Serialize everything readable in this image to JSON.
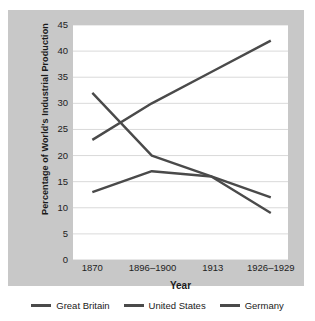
{
  "chart_data": {
    "type": "line",
    "title": "",
    "subtitle": "",
    "xlabel": "Year",
    "ylabel": "Percentage of World's Industrial Production",
    "categories": [
      "1870",
      "1896–1900",
      "1913",
      "1926–1929"
    ],
    "series": [
      {
        "name": "Great Britain",
        "values": [
          32,
          20,
          16,
          12
        ],
        "color": "#4a4a4a"
      },
      {
        "name": "United States",
        "values": [
          23,
          30,
          36,
          42
        ],
        "color": "#4a4a4a"
      },
      {
        "name": "Germany",
        "values": [
          13,
          17,
          16,
          9
        ],
        "color": "#4a4a4a"
      }
    ],
    "ylim": [
      0,
      45
    ],
    "yticks": [
      0,
      5,
      10,
      15,
      20,
      25,
      30,
      35,
      40,
      45
    ],
    "ytick_labels": [
      "0",
      "5",
      "10",
      "15",
      "20",
      "25",
      "30",
      "35",
      "40",
      "45"
    ],
    "grid": "horizontal",
    "legend_position": "bottom",
    "plot_background": "#ffffff",
    "panel_background": "#c8c8c8",
    "gridline_color": "#cfcfcf",
    "line_color": "#4a4a4a"
  },
  "axes": {
    "y_title": "Percentage of World's Industrial Production",
    "x_title": "Year",
    "y_tick_labels": [
      "45",
      "40",
      "35",
      "30",
      "25",
      "20",
      "15",
      "10",
      "5",
      "0"
    ],
    "x_tick_labels": [
      "1870",
      "1896–1900",
      "1913",
      "1926–1929"
    ]
  },
  "legend": {
    "items": [
      {
        "label": "Great Britain"
      },
      {
        "label": "United States"
      },
      {
        "label": "Germany"
      }
    ]
  }
}
